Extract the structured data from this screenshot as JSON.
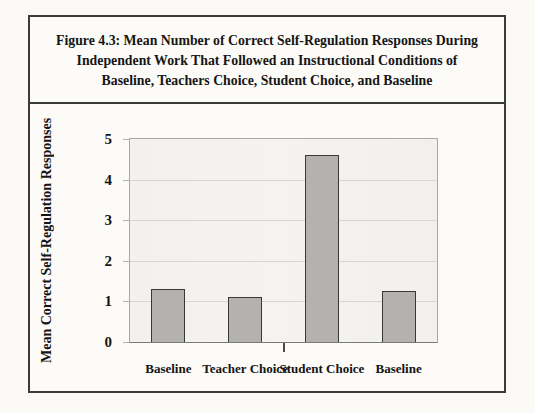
{
  "figure": {
    "title_lines": [
      "Figure 4.3: Mean Number of Correct Self-Regulation Responses During",
      "Independent Work That Followed an Instructional Conditions of",
      "Baseline, Teachers Choice, Student Choice, and Baseline"
    ]
  },
  "chart_data": {
    "type": "bar",
    "categories": [
      "Baseline",
      "Teacher Choice",
      "Student Choice",
      "Baseline"
    ],
    "values": [
      1.3,
      1.1,
      4.6,
      1.25
    ],
    "title": "Figure 4.3: Mean Number of Correct Self-Regulation Responses During Independent Work That Followed an Instructional Conditions of Baseline, Teachers Choice, Student Choice, and Baseline",
    "xlabel": "",
    "ylabel": "Mean Correct Self-Regulation Responses",
    "yticks": [
      0,
      1,
      2,
      3,
      4,
      5
    ],
    "ylim": [
      0,
      5
    ],
    "grid": true,
    "legend": false,
    "colors": {
      "bar_fill": "#b3b2b0",
      "bar_border": "#383838",
      "grid_line": "#d7d6d2",
      "plot_background": "#f2f1ee",
      "frame_border": "#3b3b3b"
    }
  }
}
